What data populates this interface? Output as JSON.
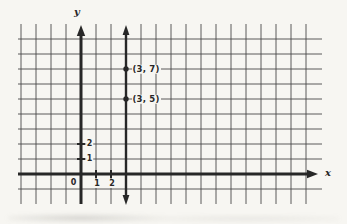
{
  "figure": {
    "background": "#f7f6f2",
    "ink_color": "#272727",
    "grid_color": "#474747"
  },
  "chart_data": {
    "type": "scatter",
    "title": "",
    "points": [
      {
        "x": 3,
        "y": 7,
        "label": "(3, 7)"
      },
      {
        "x": 3,
        "y": 5,
        "label": "(3, 5)"
      }
    ],
    "vertical_line": {
      "x": 3
    },
    "axes": {
      "xlabel": "x",
      "ylabel": "y",
      "origin_label": "0",
      "x_ticks": [
        1,
        2
      ],
      "x_tick_labels": [
        "1",
        "2"
      ],
      "y_ticks": [
        1,
        2
      ],
      "y_tick_labels": [
        "1",
        "2"
      ],
      "xlim": [
        -4,
        15
      ],
      "ylim": [
        -1,
        9
      ],
      "grid": true,
      "legend": "none"
    }
  }
}
